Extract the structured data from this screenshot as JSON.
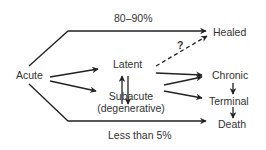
{
  "diagram": {
    "nodes": {
      "acute": "Acute",
      "latent": "Latent",
      "subacute": "Subacute",
      "subacute_sub": "(degenerative)",
      "healed": "Healed",
      "chronic": "Chronic",
      "terminal": "Terminal",
      "death": "Death"
    },
    "edge_labels": {
      "top": "80–90%",
      "bottom": "Less than 5%",
      "question": "?"
    },
    "edges": [
      {
        "from": "Acute",
        "to": "Healed",
        "label": "80–90%"
      },
      {
        "from": "Acute",
        "to": "Latent"
      },
      {
        "from": "Acute",
        "to": "Subacute"
      },
      {
        "from": "Latent",
        "to": "Subacute"
      },
      {
        "from": "Subacute",
        "to": "Latent"
      },
      {
        "from": "Latent",
        "to": "Healed",
        "label": "?",
        "style": "dashed"
      },
      {
        "from": "Latent",
        "to": "Chronic"
      },
      {
        "from": "Subacute",
        "to": "Chronic"
      },
      {
        "from": "Subacute",
        "to": "Terminal"
      },
      {
        "from": "Chronic",
        "to": "Terminal"
      },
      {
        "from": "Terminal",
        "to": "Death"
      },
      {
        "from": "Acute",
        "to": "Death",
        "label": "Less than 5%"
      }
    ],
    "colors": {
      "line": "#222222",
      "text": "#333333"
    }
  }
}
